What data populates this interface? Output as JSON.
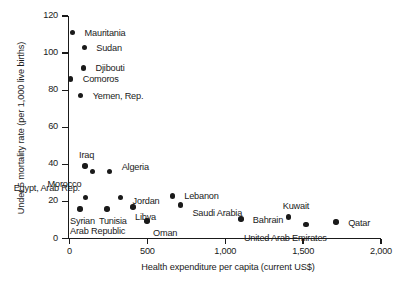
{
  "chart_data": {
    "type": "scatter",
    "title": "",
    "xlabel": "Health expenditure per capita (current US$)",
    "ylabel": "Under 5 mortality rate (per 1,000 live births)",
    "xlim": [
      0,
      2000
    ],
    "ylim": [
      0,
      120
    ],
    "xticks": [
      "0",
      "500",
      "1,000",
      "1,500",
      "2,000"
    ],
    "xtick_values": [
      0,
      500,
      1000,
      1500,
      2000
    ],
    "yticks": [
      "0",
      "20",
      "40",
      "60",
      "80",
      "100",
      "120"
    ],
    "ytick_values": [
      0,
      20,
      40,
      60,
      80,
      100,
      120
    ],
    "grid": false,
    "legend": "none",
    "marker_color": "#1a1a1a",
    "points": [
      {
        "label": "Mauritania",
        "x": 20,
        "y": 111,
        "lx": 12,
        "ly": -4
      },
      {
        "label": "Sudan",
        "x": 95,
        "y": 103,
        "lx": 12,
        "ly": -4
      },
      {
        "label": "Djibouti",
        "x": 90,
        "y": 92,
        "lx": 12,
        "ly": -4
      },
      {
        "label": "Comoros",
        "x": 8,
        "y": 86,
        "lx": 12,
        "ly": -4
      },
      {
        "label": "Yemen, Rep.",
        "x": 72,
        "y": 77,
        "lx": 12,
        "ly": -4
      },
      {
        "label": "Iraq",
        "x": 100,
        "y": 39,
        "lx": -6,
        "ly": -15
      },
      {
        "label": "Morocco",
        "x": 148,
        "y": 36,
        "lx": -45,
        "ly": 8
      },
      {
        "label": "Algeria",
        "x": 258,
        "y": 36,
        "lx": 12,
        "ly": -9
      },
      {
        "label": "Egypt, Arab Rep.",
        "x": 104,
        "y": 22,
        "lx": -72,
        "ly": -14
      },
      {
        "label": "Jordan",
        "x": 328,
        "y": 22,
        "lx": 12,
        "ly": -1
      },
      {
        "label": "Lebanon",
        "x": 660,
        "y": 23,
        "lx": 12,
        "ly": -4
      },
      {
        "label": "Saudi Arabia",
        "x": 712,
        "y": 18,
        "lx": 12,
        "ly": 4
      },
      {
        "label": "Syrian\nArab Republic",
        "x": 68,
        "y": 16,
        "lx": -10,
        "ly": 8
      },
      {
        "label": "Tunisia",
        "x": 240,
        "y": 16,
        "lx": -8,
        "ly": 8
      },
      {
        "label": "Libya",
        "x": 408,
        "y": 17,
        "lx": 2,
        "ly": 6
      },
      {
        "label": "Oman",
        "x": 498,
        "y": 9.5,
        "lx": 6,
        "ly": 8
      },
      {
        "label": "Bahrain",
        "x": 1100,
        "y": 10.5,
        "lx": 12,
        "ly": -3
      },
      {
        "label": "Kuwait",
        "x": 1408,
        "y": 11.5,
        "lx": -6,
        "ly": -15
      },
      {
        "label": "United Arab Emirates",
        "x": 1518,
        "y": 7.5,
        "lx": -62,
        "ly": 9
      },
      {
        "label": "Qatar",
        "x": 1712,
        "y": 9,
        "lx": 12,
        "ly": -3
      }
    ]
  }
}
